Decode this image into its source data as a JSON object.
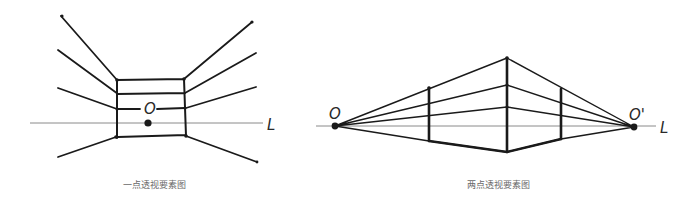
{
  "diagrams": [
    {
      "id": "one-point",
      "caption": "一点透视要素图",
      "vanishing_point_label": "O",
      "horizon_label": "L"
    },
    {
      "id": "two-point",
      "caption": "两点透视要素图",
      "vanishing_point_left_label": "O",
      "vanishing_point_right_label": "O'",
      "horizon_label": "L"
    }
  ],
  "colors": {
    "ink": "#1a1a1a",
    "horizon": "#8a8a8a",
    "caption": "#6a6a6a"
  }
}
